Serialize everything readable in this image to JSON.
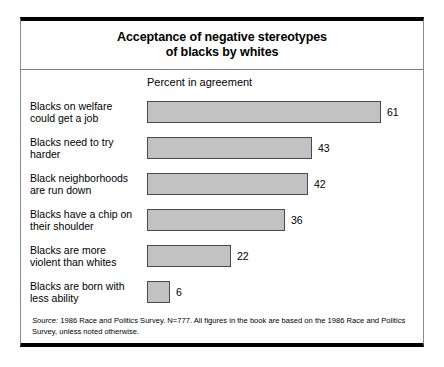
{
  "figure": {
    "title_lines": [
      "Acceptance of negative stereotypes",
      "of blacks by whites"
    ],
    "axis_caption": "Percent in agreement",
    "source_label": "Source:",
    "source_text": " 1986 Race and Politics Survey. N=777. All figures in the book are based on the 1986 Race and Politics Survey, unless noted otherwise.",
    "colors": {
      "bar_fill": "#c2c2c2",
      "bar_stroke": "#4a4a4a",
      "frame": "#000000",
      "text": "#000000"
    }
  },
  "chart_data": {
    "type": "bar",
    "orientation": "horizontal",
    "title": "Acceptance of negative stereotypes of blacks by whites",
    "xlabel": "Percent in agreement",
    "ylabel": "",
    "xlim": [
      0,
      61
    ],
    "grid": false,
    "legend": false,
    "categories": [
      "Blacks on welfare could get a job",
      "Blacks need to try harder",
      "Black neighborhoods are run down",
      "Blacks have a chip on their shoulder",
      "Blacks are more violent than whites",
      "Blacks are born with less ability"
    ],
    "category_lines": [
      [
        "Blacks on welfare",
        "could get a job"
      ],
      [
        "Blacks need to try",
        "harder"
      ],
      [
        "Black neighborhoods",
        "are run down"
      ],
      [
        "Blacks have a chip on",
        "their shoulder"
      ],
      [
        "Blacks are more",
        "violent than whites"
      ],
      [
        "Blacks are born with",
        "less ability"
      ]
    ],
    "values": [
      61,
      43,
      42,
      36,
      22,
      6
    ],
    "value_labels": [
      "61",
      "43",
      "42",
      "36",
      "22",
      "6"
    ],
    "units": "percent"
  }
}
